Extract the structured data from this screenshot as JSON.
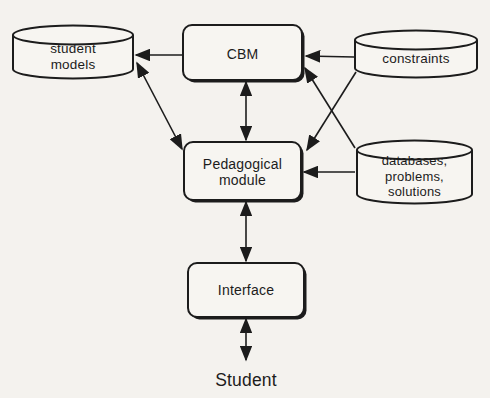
{
  "colors": {
    "ink": "#1c1c1c",
    "paper": "#f4f2ee",
    "shape_fill": "#f7f5f1"
  },
  "nodes": {
    "student_models": {
      "type": "cylinder",
      "label": "student\nmodels"
    },
    "cbm": {
      "type": "box",
      "label": "CBM"
    },
    "constraints": {
      "type": "cylinder",
      "label": "constraints"
    },
    "pedagogical_module": {
      "type": "box",
      "label": "Pedagogical\nmodule"
    },
    "databases": {
      "type": "cylinder",
      "label": "databases,\nproblems,\nsolutions"
    },
    "interface": {
      "type": "box",
      "label": "Interface"
    },
    "student": {
      "type": "text",
      "label": "Student"
    }
  },
  "edges": [
    {
      "from": "cbm",
      "to": "student_models",
      "bidirectional": false
    },
    {
      "from": "student_models",
      "to": "pedagogical_module",
      "bidirectional": true
    },
    {
      "from": "cbm",
      "to": "pedagogical_module",
      "bidirectional": true
    },
    {
      "from": "constraints",
      "to": "cbm",
      "bidirectional": false
    },
    {
      "from": "constraints",
      "to": "pedagogical_module",
      "bidirectional": false
    },
    {
      "from": "databases",
      "to": "cbm",
      "bidirectional": false
    },
    {
      "from": "databases",
      "to": "pedagogical_module",
      "bidirectional": false
    },
    {
      "from": "pedagogical_module",
      "to": "interface",
      "bidirectional": true
    },
    {
      "from": "interface",
      "to": "student",
      "bidirectional": true
    }
  ]
}
